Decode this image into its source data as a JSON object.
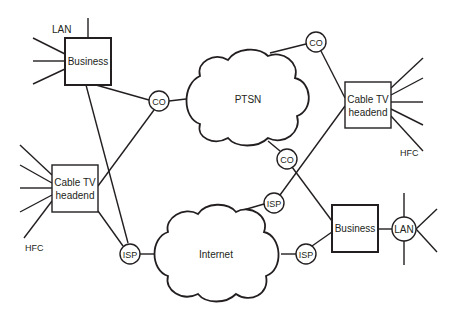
{
  "diagram": {
    "type": "network-topology",
    "nodes": {
      "business_top": {
        "label": "Business"
      },
      "lan_top_label": {
        "label": "LAN"
      },
      "co_left": {
        "label": "CO"
      },
      "ptsn": {
        "label": "PTSN"
      },
      "co_top_right": {
        "label": "CO"
      },
      "cable_right": {
        "line1": "Cable TV",
        "line2": "headend"
      },
      "hfc_right": {
        "label": "HFC"
      },
      "co_middle": {
        "label": "CO"
      },
      "isp_upper": {
        "label": "ISP"
      },
      "cable_left": {
        "line1": "Cable TV",
        "line2": "headend"
      },
      "hfc_left": {
        "label": "HFC"
      },
      "isp_left": {
        "label": "ISP"
      },
      "internet": {
        "label": "Internet"
      },
      "isp_right": {
        "label": "ISP"
      },
      "business_bottom": {
        "label": "Business"
      },
      "lan_bottom": {
        "label": "LAN"
      }
    },
    "edges": [
      [
        "business_top",
        "co_left"
      ],
      [
        "business_top",
        "isp_left"
      ],
      [
        "co_left",
        "ptsn"
      ],
      [
        "co_left",
        "cable_left"
      ],
      [
        "ptsn",
        "co_top_right"
      ],
      [
        "co_top_right",
        "cable_right"
      ],
      [
        "ptsn",
        "co_middle"
      ],
      [
        "co_middle",
        "business_bottom"
      ],
      [
        "cable_right",
        "isp_upper"
      ],
      [
        "isp_upper",
        "internet"
      ],
      [
        "cable_left",
        "isp_left"
      ],
      [
        "isp_left",
        "internet"
      ],
      [
        "internet",
        "isp_right"
      ],
      [
        "isp_right",
        "business_bottom"
      ],
      [
        "business_bottom",
        "lan_bottom"
      ]
    ],
    "colors": {
      "stroke": "#231f20",
      "background": "#ffffff"
    }
  }
}
